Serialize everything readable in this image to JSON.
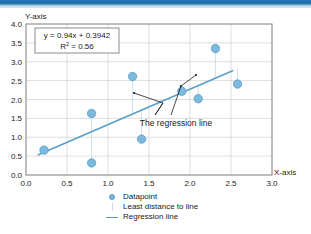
{
  "banner": {
    "color": "#1d6ea9"
  },
  "axes": {
    "y_title": "Y-axis",
    "x_title": "X-axis",
    "x_ticks": [
      "0.0",
      "0.5",
      "1.0",
      "1.5",
      "2.0",
      "2.5",
      "3.0"
    ],
    "y_ticks": [
      "0.0",
      "0.5",
      "1.0",
      "1.5",
      "2.0",
      "2.5",
      "3.0",
      "3.5",
      "4.0"
    ]
  },
  "equation_box": {
    "line1": "y = 0.94x + 0.3942",
    "line2_prefix": "R",
    "line2_sup": "2",
    "line2_suffix": " = 0.56"
  },
  "annotation": {
    "text": "The regression line"
  },
  "legend": {
    "items": [
      {
        "label": "Datapoint",
        "marker": "circle-marker-icon",
        "color": "#7db9dc"
      },
      {
        "label": "Least distance to line",
        "marker": "vertical-line-icon",
        "color": "#c9dcea"
      },
      {
        "label": "Regression line",
        "marker": "horizontal-line-icon",
        "color": "#5a9fc9"
      }
    ]
  },
  "bottom_caption": {
    "text": ""
  },
  "chart_data": {
    "type": "scatter",
    "title": "",
    "xlabel": "X-axis",
    "ylabel": "Y-axis",
    "xlim": [
      0.0,
      3.0
    ],
    "ylim": [
      0.0,
      4.0
    ],
    "xtick_step": 0.5,
    "ytick_step": 0.5,
    "grid": true,
    "legend_position": "bottom-center",
    "marker_color": "#7db9dc",
    "line_color": "#5a9fc9",
    "residual_color": "#c9dcea",
    "points": [
      {
        "x": 0.22,
        "y": 0.66
      },
      {
        "x": 0.8,
        "y": 0.32
      },
      {
        "x": 0.8,
        "y": 1.63
      },
      {
        "x": 1.3,
        "y": 2.61
      },
      {
        "x": 1.41,
        "y": 0.95
      },
      {
        "x": 1.9,
        "y": 2.22
      },
      {
        "x": 2.1,
        "y": 2.02
      },
      {
        "x": 2.31,
        "y": 3.35
      },
      {
        "x": 2.58,
        "y": 2.41
      }
    ],
    "series": [
      {
        "name": "Datapoint",
        "type": "scatter",
        "x": [
          0.22,
          0.8,
          0.8,
          1.3,
          1.41,
          1.9,
          2.1,
          2.31,
          2.58
        ],
        "values": [
          0.66,
          0.32,
          1.63,
          2.61,
          0.95,
          2.22,
          2.02,
          3.35,
          2.41
        ]
      },
      {
        "name": "Regression line",
        "type": "line",
        "slope": 0.94,
        "intercept": 0.3942,
        "r_squared": 0.56,
        "x": [
          0.15,
          2.52
        ],
        "values": [
          0.535,
          2.763
        ]
      }
    ],
    "annotations": [
      {
        "text": "The regression line",
        "x": 1.7,
        "y": 1.15
      }
    ]
  }
}
